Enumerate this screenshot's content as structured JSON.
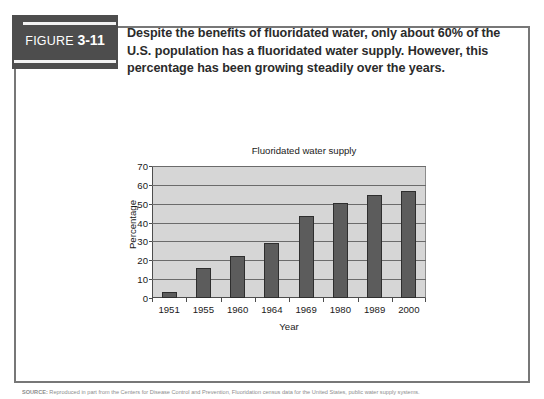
{
  "figure": {
    "tag_prefix": "FIGURE ",
    "tag_number": "3-11",
    "caption_line1": "Despite the benefits of fluoridated water, only about 60% of the",
    "caption_line2": "U.S. population has a fluoridated water supply. However, this",
    "caption_line3": "percentage has been growing steadily over the years.",
    "source_label": "SOURCE:",
    "source_text": " Reproduced in part from the Centers for Disease Control and Prevention, Fluoridation census data for the United States, public water supply systems."
  },
  "colors": {
    "tag_background": "#4d4d4d",
    "tag_text": "#ffffff",
    "frame_border": "#777777",
    "plot_background": "#d6d6d6",
    "bar_fill": "#5c5c5c",
    "bar_border": "#2e2e2e",
    "gridline": "#6b6b6b",
    "caption_text": "#2b2b2b"
  },
  "chart_data": {
    "type": "bar",
    "title": "Fluoridated water supply",
    "xlabel": "Year",
    "ylabel": "Percentage",
    "categories": [
      "1951",
      "1955",
      "1960",
      "1964",
      "1969",
      "1980",
      "1989",
      "2000"
    ],
    "values": [
      3,
      16,
      22.5,
      29,
      43.5,
      50.5,
      54.5,
      57
    ],
    "ylim": [
      0,
      70
    ],
    "ytick_step": 10,
    "yticks": [
      "70",
      "60",
      "50",
      "40",
      "30",
      "20",
      "10",
      "0"
    ],
    "ytick_values": [
      70,
      60,
      50,
      40,
      30,
      20,
      10,
      0
    ],
    "grid": "horizontal",
    "legend": "none"
  }
}
